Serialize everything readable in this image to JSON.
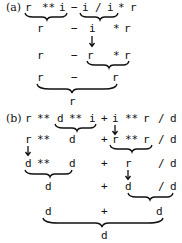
{
  "part_a": {
    "label": "(a)",
    "rows": [
      {
        "tokens": [
          "r",
          "**",
          "i",
          "−",
          "i",
          "/",
          "i",
          "*",
          "r"
        ]
      },
      {
        "tokens": [
          "r",
          "−",
          "i",
          "*",
          "r"
        ]
      },
      {
        "tokens": [
          "r",
          "−",
          "r",
          "*",
          "r"
        ]
      },
      {
        "tokens": [
          "r",
          "−",
          "r"
        ]
      },
      {
        "tokens": [
          "r"
        ]
      }
    ]
  },
  "part_b": {
    "label": "(b)",
    "rows": [
      {
        "tokens": [
          "r",
          "**",
          "d",
          "**",
          "i",
          "+",
          "i",
          "**",
          "r",
          "/",
          "d"
        ]
      },
      {
        "tokens": [
          "r",
          "**",
          "d",
          "+",
          "r",
          "**",
          "r",
          "/",
          "d"
        ]
      },
      {
        "tokens": [
          "d",
          "**",
          "d",
          "+",
          "r",
          "/",
          "d"
        ]
      },
      {
        "tokens": [
          "d",
          "+",
          "d",
          "/",
          "d"
        ]
      },
      {
        "tokens": [
          "d",
          "+",
          "d"
        ]
      },
      {
        "tokens": [
          "d"
        ]
      }
    ]
  }
}
